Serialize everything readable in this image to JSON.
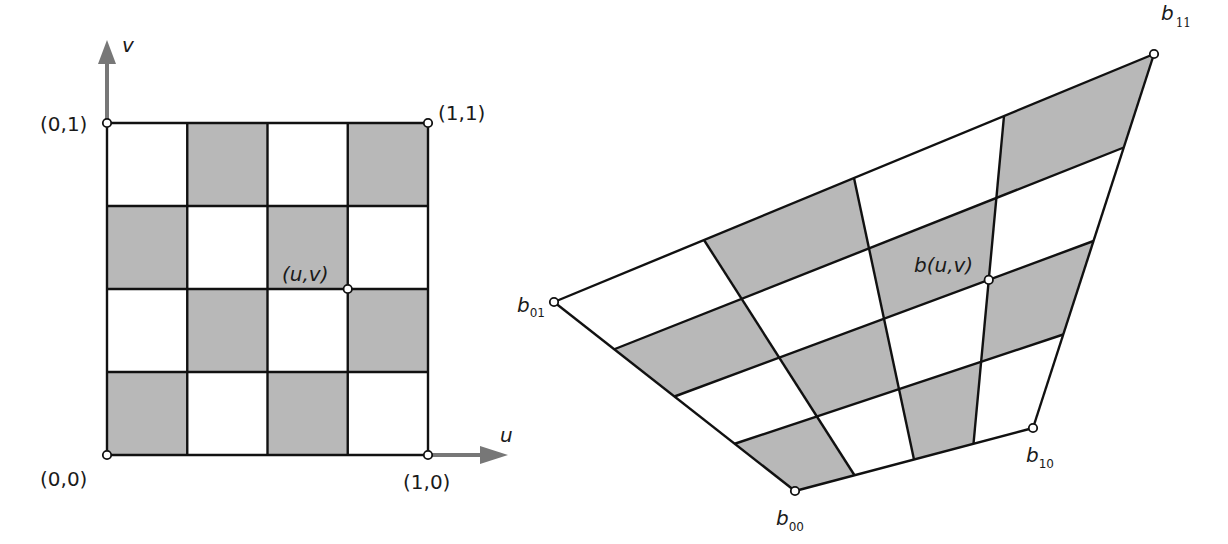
{
  "colors": {
    "cell_gray": "#b8b8b8",
    "cell_white": "#ffffff",
    "grid_line": "#111111",
    "axis_arrow": "#777777",
    "point_fill": "#ffffff",
    "point_stroke": "#111111"
  },
  "left_panel": {
    "title": "Unit parameter square",
    "grid_divisions": 4,
    "corners": {
      "c00": {
        "label": "(0,0)",
        "px": [
          107,
          455
        ]
      },
      "c10": {
        "label": "(1,0)",
        "px": [
          428,
          455
        ]
      },
      "c01": {
        "label": "(0,1)",
        "px": [
          107,
          123
        ]
      },
      "c11": {
        "label": "(1,1)",
        "px": [
          428,
          123
        ]
      }
    },
    "axes": {
      "u": {
        "label": "u"
      },
      "v": {
        "label": "v"
      }
    },
    "point": {
      "label": "(u,v)",
      "u": 0.75,
      "v": 0.5
    }
  },
  "right_panel": {
    "title": "Bilinear patch",
    "grid_divisions": 4,
    "corners": {
      "b00": {
        "base": "b",
        "sub": "00",
        "px": [
          795,
          491
        ]
      },
      "b10": {
        "base": "b",
        "sub": "10",
        "px": [
          1033,
          428
        ]
      },
      "b01": {
        "base": "b",
        "sub": "01",
        "px": [
          554,
          302
        ]
      },
      "b11": {
        "base": "b",
        "sub": "11",
        "px": [
          1154,
          54
        ]
      }
    },
    "point": {
      "label": "b(u,v)",
      "u": 0.75,
      "v": 0.5
    }
  },
  "checker_rule": "cell (i,j) gray when (i+j) is even, i = u-index, j = v-index from bottom"
}
